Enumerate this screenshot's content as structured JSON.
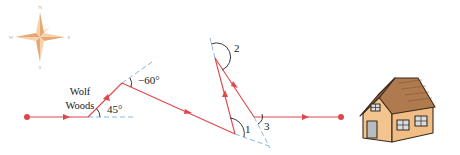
{
  "diagram": {
    "type": "path-with-turn-angles",
    "colors": {
      "path": "#e0474c",
      "dashed_reference": "#7ab0d6",
      "angle_arc": "#222222",
      "label": "#222222",
      "compass_fill_light": "#f6d3b0",
      "compass_fill_dark": "#e9a873",
      "house_wall": "#f2c48e",
      "house_roof": "#b07a4f",
      "house_outline": "#3a2a1e"
    },
    "compass": {
      "directions": [
        "N",
        "E",
        "S",
        "W"
      ]
    },
    "landmark": {
      "line1": "Wolf",
      "line2": "Woods"
    },
    "angles": {
      "first_turn": "45°",
      "second_turn": "−60°",
      "angle_1": "1",
      "angle_2": "2",
      "angle_3": "3"
    },
    "destination": "house"
  }
}
